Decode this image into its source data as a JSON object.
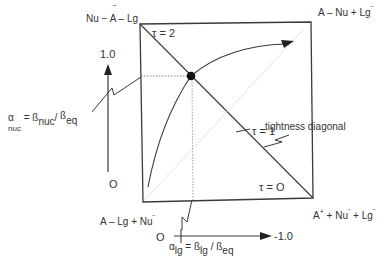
{
  "figure": {
    "corners": {
      "top_left": "Nu − Ā − Lg",
      "top_right": "A − Nu + Lg⁻",
      "bottom_left": "A − Lg + Nu⁻",
      "bottom_right": "A⁺ + Nu⁻ + Lg⁻"
    },
    "corner_parts": {
      "top_left": {
        "a": "Nu − ",
        "b": "A",
        "bar": "‾",
        "c": " – Lg"
      },
      "top_right": {
        "a": "A – Nu  +  Lg",
        "sup": "‾"
      },
      "bottom_left": {
        "a": "A – Lg  +  Nu",
        "sup": "‾"
      },
      "bottom_right": {
        "a": "A",
        "sup1": "+",
        "b": " + Nu",
        "sup2": "‾",
        "c": " + Lg",
        "sup3": "‾"
      }
    },
    "tau_labels": {
      "tau2": "τ = 2",
      "tau1": "τ  =  1",
      "tau0": "τ  =  O"
    },
    "diagonal_label": "tightness diagonal",
    "y_axis": {
      "top_label": "1.0",
      "bottom_label": "O",
      "name": {
        "main": "α",
        "sub1": "nuc",
        "eq": " = ",
        "b1": "ß",
        "sub2": "nuc",
        "slash": "/ ",
        "b2": "ß",
        "sub3": "eq"
      }
    },
    "x_axis": {
      "origin_label": "O",
      "end_label": "-1.0",
      "name": {
        "main": "α",
        "sub1": "lg",
        "eq": "  =  ",
        "b1": "ß",
        "sub2": "lg",
        "slash": "  /  ",
        "b2": "ß",
        "sub3": "eq"
      }
    },
    "colors": {
      "line": "#3a3a3a",
      "dotted": "#9a9a9a",
      "text": "#333333",
      "point": "#111111"
    }
  }
}
